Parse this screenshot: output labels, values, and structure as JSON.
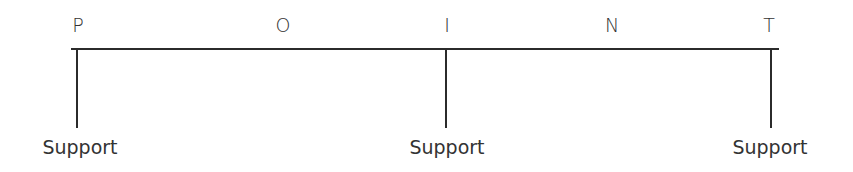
{
  "diagram": {
    "letters": [
      "P",
      "O",
      "I",
      "N",
      "T"
    ],
    "supports": [
      {
        "label": "Support"
      },
      {
        "label": "Support"
      },
      {
        "label": "Support"
      }
    ]
  }
}
